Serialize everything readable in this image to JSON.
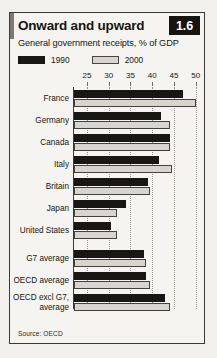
{
  "figure": {
    "title": "Onward and upward",
    "subtitle": "General government receipts, % of GDP",
    "number": "1.6",
    "source": "Source: OECD"
  },
  "legend": {
    "position": "top-left",
    "items": [
      {
        "label": "1990",
        "swatch": "dark",
        "color": "#191713"
      },
      {
        "label": "2000",
        "swatch": "light",
        "color": "#d8d5cf"
      }
    ]
  },
  "colors": {
    "series_1990": "#191713",
    "series_2000": "#d8d5cf",
    "frame": "#3d3a35",
    "background": "#f6f4f0",
    "page_background": "#f2f0ec",
    "badge_background": "#16140f",
    "badge_text": "#ffffff",
    "gridline": "#9a968e"
  },
  "chart_data": {
    "type": "bar",
    "orientation": "horizontal",
    "title": "Onward and upward",
    "subtitle": "General government receipts, % of GDP",
    "xlabel": "",
    "ylabel": "",
    "xlim": [
      22,
      51
    ],
    "axis_ticks": [
      25,
      30,
      35,
      40,
      45,
      50
    ],
    "tick_labels": [
      "25",
      "30",
      "35",
      "40",
      "45",
      "50"
    ],
    "grid": true,
    "grid_axis": "x",
    "legend_position": "top-left",
    "categories": [
      "France",
      "Germany",
      "Canada",
      "Italy",
      "Britain",
      "Japan",
      "United States",
      "G7 average",
      "OECD average",
      "OECD excl G7 average"
    ],
    "series": [
      {
        "name": "1990",
        "color": "#191713",
        "values": [
          47.0,
          42.0,
          44.0,
          41.5,
          39.0,
          34.0,
          30.5,
          38.0,
          38.5,
          43.0
        ]
      },
      {
        "name": "2000",
        "color": "#d8d5cf",
        "values": [
          50.0,
          44.0,
          44.0,
          44.5,
          39.5,
          32.0,
          32.0,
          38.5,
          39.5,
          44.0
        ]
      }
    ],
    "source": "Source: OECD"
  }
}
